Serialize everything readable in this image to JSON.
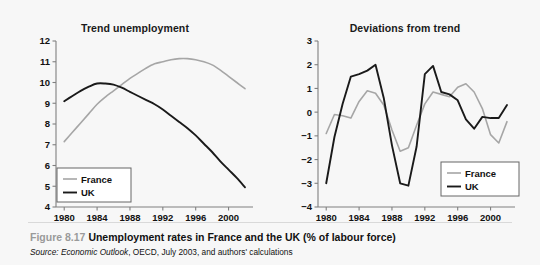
{
  "figure": {
    "number": "Figure 8.17",
    "title": "Unemployment rates in France and the UK (% of labour force)",
    "source_label": "Source:",
    "source_italic": "Economic Outlook",
    "source_rest": ", OECD, July 2003, and authors' calculations"
  },
  "colors": {
    "france": "#a6a6a6",
    "uk": "#1a1a1a",
    "axis": "#808080",
    "background": "#f7f7f7",
    "caption_number": "#9a9a9a"
  },
  "legend": {
    "france_label": "France",
    "uk_label": "UK"
  },
  "chart_data": [
    {
      "type": "line",
      "title": "Trend unemployment",
      "xlabel": "",
      "ylabel": "",
      "xlim": [
        1979,
        2002
      ],
      "ylim": [
        4,
        12
      ],
      "yticks": [
        4,
        5,
        6,
        7,
        8,
        9,
        10,
        11,
        12
      ],
      "xticks": [
        1980,
        1984,
        1988,
        1992,
        1996,
        2000
      ],
      "grid": false,
      "legend_position": "bottom-left",
      "x": [
        1980,
        1981,
        1982,
        1983,
        1984,
        1985,
        1986,
        1987,
        1988,
        1989,
        1990,
        1991,
        1992,
        1993,
        1994,
        1995,
        1996,
        1997,
        1998,
        1999,
        2000,
        2001,
        2002
      ],
      "series": [
        {
          "name": "France",
          "color": "#a6a6a6",
          "values": [
            7.15,
            7.6,
            8.05,
            8.5,
            8.95,
            9.3,
            9.6,
            9.9,
            10.2,
            10.45,
            10.7,
            10.9,
            11.0,
            11.1,
            11.15,
            11.15,
            11.1,
            11.0,
            10.85,
            10.6,
            10.3,
            10.0,
            9.7
          ]
        },
        {
          "name": "UK",
          "color": "#1a1a1a",
          "values": [
            9.1,
            9.35,
            9.6,
            9.8,
            9.95,
            9.95,
            9.9,
            9.75,
            9.55,
            9.35,
            9.15,
            8.95,
            8.7,
            8.4,
            8.1,
            7.8,
            7.45,
            7.05,
            6.65,
            6.2,
            5.8,
            5.4,
            4.95
          ]
        }
      ]
    },
    {
      "type": "line",
      "title": "Deviations from trend",
      "xlabel": "",
      "ylabel": "",
      "xlim": [
        1979,
        2002
      ],
      "ylim": [
        -4,
        3
      ],
      "yticks": [
        -4,
        -3,
        -2,
        -1,
        0,
        1,
        2,
        3
      ],
      "xticks": [
        1980,
        1984,
        1988,
        1992,
        1996,
        2000
      ],
      "grid": false,
      "legend_position": "bottom-right",
      "x": [
        1980,
        1981,
        1982,
        1983,
        1984,
        1985,
        1986,
        1987,
        1988,
        1989,
        1990,
        1991,
        1992,
        1993,
        1994,
        1995,
        1996,
        1997,
        1998,
        1999,
        2000,
        2001,
        2002
      ],
      "series": [
        {
          "name": "France",
          "color": "#a6a6a6",
          "values": [
            -0.9,
            -0.1,
            -0.15,
            -0.25,
            0.45,
            0.9,
            0.8,
            0.3,
            -0.75,
            -1.65,
            -1.5,
            -0.55,
            0.35,
            0.85,
            0.75,
            0.65,
            1.05,
            1.2,
            0.85,
            0.15,
            -0.95,
            -1.3,
            -0.4
          ]
        },
        {
          "name": "UK",
          "color": "#1a1a1a",
          "values": [
            -3.0,
            -1.05,
            0.35,
            1.5,
            1.6,
            1.75,
            2.0,
            0.6,
            -1.4,
            -3.0,
            -3.1,
            -1.45,
            1.6,
            1.95,
            0.85,
            0.75,
            0.5,
            -0.3,
            -0.7,
            -0.2,
            -0.25,
            -0.25,
            0.3
          ]
        }
      ]
    }
  ]
}
